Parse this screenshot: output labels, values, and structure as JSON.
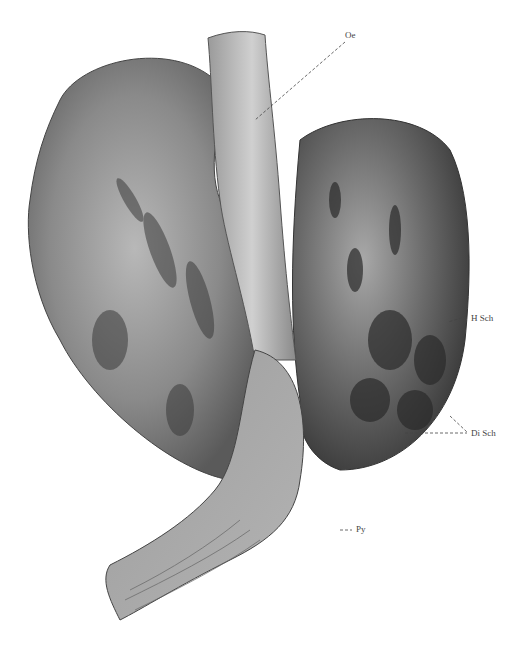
{
  "figure": {
    "labels": [
      {
        "id": "oe",
        "text": "Oe"
      },
      {
        "id": "h_sch",
        "text": "H Sch"
      },
      {
        "id": "di_sch",
        "text": "Di Sch"
      },
      {
        "id": "py",
        "text": "Py"
      }
    ]
  }
}
